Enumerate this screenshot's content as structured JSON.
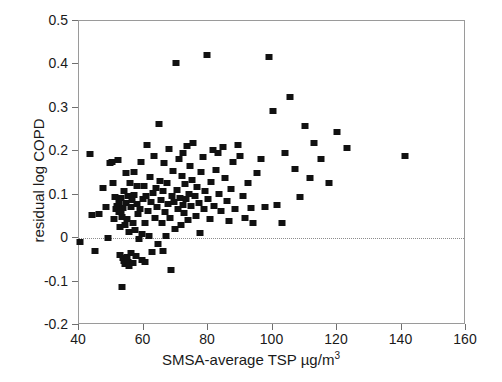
{
  "chart_data": {
    "type": "scatter",
    "title": "",
    "xlabel": "SMSA-average TSP µg/m",
    "xlabel_sup": "3",
    "ylabel": "residual log COPD",
    "xlim": [
      40,
      160
    ],
    "ylim": [
      -0.2,
      0.5
    ],
    "xticks": [
      40,
      60,
      80,
      100,
      120,
      140,
      160
    ],
    "xtick_labels": [
      "40",
      "60",
      "80",
      "100",
      "120",
      "140",
      "160"
    ],
    "yticks": [
      -0.2,
      -0.1,
      0,
      0.1,
      0.2,
      0.3,
      0.4,
      0.5
    ],
    "ytick_labels": [
      "-0.2",
      "-0.1",
      "0",
      "0.1",
      "0.2",
      "0.3",
      "0.4",
      "0.5"
    ],
    "grid": false,
    "legend": null,
    "reference_lines": [
      {
        "name": "zero-line",
        "orientation": "horizontal",
        "y": 0,
        "style": "dotted",
        "color": "#8c8c8c"
      }
    ],
    "marker": {
      "shape": "square",
      "color": "#111111",
      "size_px": 7
    },
    "series": [
      {
        "name": "SMSA observations",
        "points": [
          [
            40.2,
            -0.008
          ],
          [
            43.4,
            0.193
          ],
          [
            44.0,
            0.053
          ],
          [
            44.9,
            -0.03
          ],
          [
            46.2,
            0.056
          ],
          [
            47.5,
            0.116
          ],
          [
            48.4,
            0.071
          ],
          [
            49.0,
            0.001
          ],
          [
            49.6,
            0.174
          ],
          [
            50.1,
            0.176
          ],
          [
            50.4,
            0.128
          ],
          [
            50.9,
            0.044
          ],
          [
            51.2,
            0.095
          ],
          [
            51.6,
            0.067
          ],
          [
            51.9,
            0.074
          ],
          [
            52.0,
            0.179
          ],
          [
            52.3,
            0.061
          ],
          [
            52.5,
            0.083
          ],
          [
            52.6,
            0.026
          ],
          [
            52.8,
            -0.038
          ],
          [
            53.0,
            0.093
          ],
          [
            53.1,
            0.061
          ],
          [
            53.3,
            0.048
          ],
          [
            53.4,
            -0.112
          ],
          [
            53.6,
            0.07
          ],
          [
            53.7,
            -0.046
          ],
          [
            53.9,
            0.108
          ],
          [
            54.0,
            -0.052
          ],
          [
            54.2,
            0.031
          ],
          [
            54.3,
            -0.06
          ],
          [
            54.5,
            0.08
          ],
          [
            54.6,
            0.15
          ],
          [
            54.8,
            -0.044
          ],
          [
            55.0,
            0.043
          ],
          [
            55.1,
            -0.056
          ],
          [
            55.3,
            0.098
          ],
          [
            55.4,
            0.014
          ],
          [
            55.6,
            -0.063
          ],
          [
            55.8,
            0.126
          ],
          [
            56.0,
            0.071
          ],
          [
            56.2,
            -0.035
          ],
          [
            56.4,
            0.088
          ],
          [
            56.6,
            0.036
          ],
          [
            56.8,
            -0.058
          ],
          [
            57.0,
            0.153
          ],
          [
            57.2,
            0.1
          ],
          [
            57.4,
            0.019
          ],
          [
            57.6,
            -0.042
          ],
          [
            57.9,
            0.079
          ],
          [
            58.1,
            0.119
          ],
          [
            58.4,
            0.056
          ],
          [
            58.6,
            -0.003
          ],
          [
            58.9,
            0.068
          ],
          [
            59.1,
            0.176
          ],
          [
            59.4,
            0.01
          ],
          [
            59.6,
            -0.05
          ],
          [
            59.9,
            0.089
          ],
          [
            60.1,
            0.12
          ],
          [
            60.4,
            0.035
          ],
          [
            60.6,
            -0.055
          ],
          [
            60.9,
            0.098
          ],
          [
            61.2,
            0.215
          ],
          [
            61.4,
            0.063
          ],
          [
            61.7,
            0.006
          ],
          [
            62.0,
            0.141
          ],
          [
            62.3,
            0.084
          ],
          [
            62.6,
            -0.031
          ],
          [
            62.9,
            0.104
          ],
          [
            63.2,
            0.19
          ],
          [
            63.5,
            0.047
          ],
          [
            63.8,
            0.115
          ],
          [
            64.1,
            0.071
          ],
          [
            64.4,
            -0.014
          ],
          [
            64.7,
            0.263
          ],
          [
            65.0,
            0.132
          ],
          [
            65.3,
            0.088
          ],
          [
            65.6,
            0.036
          ],
          [
            65.9,
            -0.029
          ],
          [
            66.2,
            0.109
          ],
          [
            66.5,
            0.172
          ],
          [
            66.8,
            0.061
          ],
          [
            67.1,
            0.004
          ],
          [
            67.4,
            0.127
          ],
          [
            67.7,
            0.079
          ],
          [
            68.0,
            0.205
          ],
          [
            68.3,
            0.046
          ],
          [
            68.6,
            -0.073
          ],
          [
            68.9,
            0.098
          ],
          [
            69.2,
            0.154
          ],
          [
            69.5,
            0.084
          ],
          [
            69.8,
            0.021
          ],
          [
            70.0,
            0.403
          ],
          [
            70.3,
            0.112
          ],
          [
            70.6,
            0.066
          ],
          [
            70.9,
            0.182
          ],
          [
            71.2,
            0.093
          ],
          [
            71.5,
            0.03
          ],
          [
            71.8,
            0.142
          ],
          [
            72.1,
            0.076
          ],
          [
            72.4,
            0.196
          ],
          [
            72.7,
            0.057
          ],
          [
            73.0,
            0.125
          ],
          [
            73.3,
            0.089
          ],
          [
            73.6,
            0.213
          ],
          [
            73.9,
            0.041
          ],
          [
            74.2,
            0.101
          ],
          [
            74.5,
            0.166
          ],
          [
            74.8,
            0.074
          ],
          [
            75.1,
            0.134
          ],
          [
            75.5,
            0.218
          ],
          [
            75.9,
            0.096
          ],
          [
            76.3,
            0.052
          ],
          [
            76.7,
            0.117
          ],
          [
            77.1,
            0.081
          ],
          [
            77.5,
            0.011
          ],
          [
            77.9,
            0.153
          ],
          [
            78.3,
            0.186
          ],
          [
            78.7,
            0.067
          ],
          [
            79.1,
            0.108
          ],
          [
            79.6,
            0.421
          ],
          [
            80.0,
            0.091
          ],
          [
            80.5,
            0.044
          ],
          [
            81.0,
            0.129
          ],
          [
            81.5,
            0.203
          ],
          [
            82.0,
            0.074
          ],
          [
            82.5,
            0.158
          ],
          [
            83.0,
            0.196
          ],
          [
            83.5,
            0.101
          ],
          [
            84.0,
            0.062
          ],
          [
            84.6,
            0.21
          ],
          [
            85.2,
            0.138
          ],
          [
            85.8,
            0.085
          ],
          [
            86.4,
            0.04
          ],
          [
            87.0,
            0.113
          ],
          [
            87.8,
            0.176
          ],
          [
            88.5,
            0.067
          ],
          [
            89.2,
            0.214
          ],
          [
            90.0,
            0.188
          ],
          [
            90.8,
            0.096
          ],
          [
            91.6,
            0.046
          ],
          [
            92.4,
            0.128
          ],
          [
            93.2,
            0.07
          ],
          [
            94.0,
            0.035
          ],
          [
            95.2,
            0.15
          ],
          [
            96.5,
            0.182
          ],
          [
            97.8,
            0.071
          ],
          [
            99.0,
            0.417
          ],
          [
            100.2,
            0.292
          ],
          [
            101.5,
            0.077
          ],
          [
            102.8,
            0.034
          ],
          [
            104.0,
            0.195
          ],
          [
            105.5,
            0.324
          ],
          [
            107.0,
            0.159
          ],
          [
            108.5,
            0.095
          ],
          [
            110.0,
            0.258
          ],
          [
            111.5,
            0.138
          ],
          [
            113.0,
            0.22
          ],
          [
            115.0,
            0.183
          ],
          [
            117.5,
            0.128
          ],
          [
            120.0,
            0.245
          ],
          [
            123.0,
            0.208
          ],
          [
            141.0,
            0.188
          ]
        ]
      }
    ]
  },
  "axes": {
    "x_title_main": "SMSA-average TSP µg/m",
    "x_title_sup": "3",
    "y_title": "residual log COPD"
  }
}
